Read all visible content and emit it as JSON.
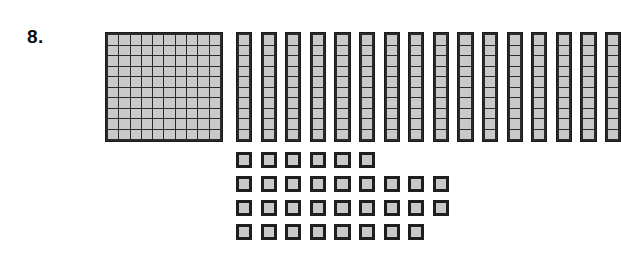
{
  "page": {
    "background_color": "#ffffff",
    "kind": "math-worksheet-problem"
  },
  "problem": {
    "number_label": "8.",
    "topic": "base-ten-blocks place value representation"
  },
  "colors": {
    "block_fill": "#c9c9c9",
    "block_outline": "#1a1a1a",
    "grid_line": "#2b2b2b",
    "text": "#0d0d0d",
    "page_background": "#ffffff"
  },
  "blocks": {
    "hundreds": {
      "label": "hundred-flat",
      "count": 1,
      "rows": 10,
      "columns": 10,
      "value_each": 100,
      "total_value": 100
    },
    "tens": {
      "label": "ten-rod",
      "count": 16,
      "cells_per_rod": 10,
      "value_each": 10,
      "total_value": 160
    },
    "ones": {
      "label": "unit-cube",
      "count": 32,
      "value_each": 1,
      "total_value": 32,
      "row_counts": [
        6,
        9,
        9,
        8
      ]
    },
    "grand_total": 292
  },
  "chart_data": {
    "type": "bar",
    "categories": [
      "Hundreds",
      "Tens",
      "Ones"
    ],
    "values": [
      1,
      16,
      32
    ],
    "xlabel": "Place value",
    "ylabel": "Number of blocks",
    "annotations": [
      "1 hundred = 100",
      "16 tens = 160",
      "32 ones = 32",
      "total = 292"
    ]
  }
}
